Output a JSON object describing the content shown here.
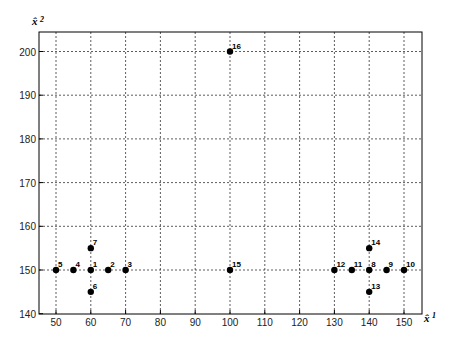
{
  "chart_data": {
    "type": "scatter",
    "title": "",
    "xlabel": "x̂1",
    "ylabel": "x̂2",
    "xlim": [
      46.5,
      155
    ],
    "ylim": [
      140,
      204.5
    ],
    "grid": true,
    "x_ticks": [
      50,
      60,
      70,
      80,
      90,
      100,
      110,
      120,
      130,
      140,
      150
    ],
    "y_ticks": [
      140,
      150,
      160,
      170,
      180,
      190,
      200
    ],
    "points": [
      {
        "label": "1",
        "x": 60,
        "y": 150
      },
      {
        "label": "2",
        "x": 65,
        "y": 150
      },
      {
        "label": "3",
        "x": 70,
        "y": 150
      },
      {
        "label": "4",
        "x": 55,
        "y": 150
      },
      {
        "label": "5",
        "x": 50,
        "y": 150
      },
      {
        "label": "6",
        "x": 60,
        "y": 145
      },
      {
        "label": "7",
        "x": 60,
        "y": 155
      },
      {
        "label": "8",
        "x": 140,
        "y": 150
      },
      {
        "label": "9",
        "x": 145,
        "y": 150
      },
      {
        "label": "10",
        "x": 150,
        "y": 150
      },
      {
        "label": "11",
        "x": 135,
        "y": 150
      },
      {
        "label": "12",
        "x": 130,
        "y": 150
      },
      {
        "label": "13",
        "x": 140,
        "y": 145
      },
      {
        "label": "14",
        "x": 140,
        "y": 155
      },
      {
        "label": "15",
        "x": 100,
        "y": 150
      },
      {
        "label": "16",
        "x": 100,
        "y": 200
      }
    ],
    "colors": {
      "point": "#000000",
      "grid": "#333333",
      "axis": "#000000"
    }
  },
  "axes": {
    "xlabel_main": "x̂",
    "xlabel_sub": "1",
    "ylabel_main": "x̂",
    "ylabel_sub": "2"
  }
}
